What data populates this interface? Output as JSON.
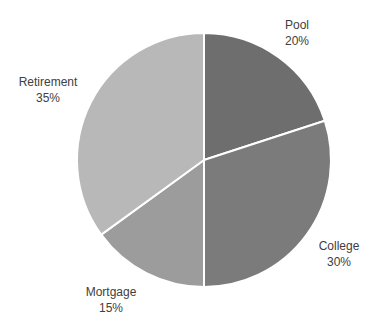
{
  "chart_data": {
    "type": "pie",
    "title": "",
    "categories": [
      "Pool",
      "College",
      "Mortgage",
      "Retirement"
    ],
    "values": [
      20,
      30,
      15,
      35
    ],
    "unit": "%",
    "start_angle_deg": 0,
    "direction": "clockwise",
    "colors": [
      "#6e6e6e",
      "#7b7b7b",
      "#9c9c9c",
      "#b8b8b8"
    ],
    "legend": "none",
    "data_labels": [
      {
        "name": "Pool",
        "value": "20%"
      },
      {
        "name": "College",
        "value": "30%"
      },
      {
        "name": "Mortgage",
        "value": "15%"
      },
      {
        "name": "Retirement",
        "value": "35%"
      }
    ]
  },
  "labels": {
    "pool": {
      "name": "Pool",
      "value": "20%"
    },
    "college": {
      "name": "College",
      "value": "30%"
    },
    "mortgage": {
      "name": "Mortgage",
      "value": "15%"
    },
    "retirement": {
      "name": "Retirement",
      "value": "35%"
    }
  }
}
